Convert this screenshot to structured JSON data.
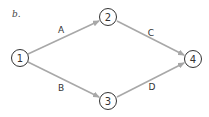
{
  "diagram": {
    "panel_label": "b.",
    "colors": {
      "edge": "#a8a8a8",
      "node_stroke": "#333333",
      "text": "#333333",
      "background": "#ffffff"
    },
    "nodes": [
      {
        "id": "1",
        "label": "1",
        "cx": 20,
        "cy": 58
      },
      {
        "id": "2",
        "label": "2",
        "cx": 108,
        "cy": 17
      },
      {
        "id": "3",
        "label": "3",
        "cx": 108,
        "cy": 101
      },
      {
        "id": "4",
        "label": "4",
        "cx": 193,
        "cy": 59
      }
    ],
    "edges": [
      {
        "from": "1",
        "to": "2",
        "label": "A",
        "label_x": 61,
        "label_y": 30
      },
      {
        "from": "1",
        "to": "3",
        "label": "B",
        "label_x": 61,
        "label_y": 88
      },
      {
        "from": "2",
        "to": "4",
        "label": "C",
        "label_x": 151,
        "label_y": 33
      },
      {
        "from": "3",
        "to": "4",
        "label": "D",
        "label_x": 152,
        "label_y": 87
      }
    ]
  }
}
